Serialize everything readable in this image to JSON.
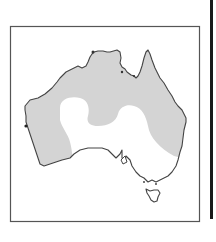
{
  "map": {
    "subject": "Australia",
    "shaded_region_color": "#d4d4d4",
    "unshaded_region_color": "#ffffff",
    "coastline_color": "#444444",
    "frame_color": "#555555",
    "regions": [
      {
        "name": "shaded-distribution",
        "description": "Northern, western and eastern Australia shaded gray"
      },
      {
        "name": "unshaded-interior",
        "description": "Central/southern interior and southeast left white"
      }
    ],
    "landmasses": [
      "mainland",
      "tasmania"
    ]
  }
}
